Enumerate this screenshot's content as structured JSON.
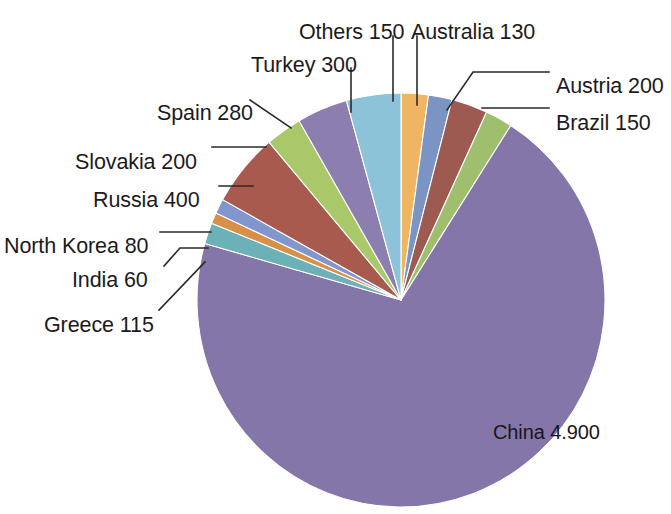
{
  "chart_data": {
    "type": "pie",
    "title": "",
    "subtitle": "",
    "xlabel": "",
    "ylabel": "",
    "legend_position": "none",
    "grid": false,
    "total": 6965,
    "value_separator": ".",
    "start_angle_deg": -90,
    "direction": "clockwise",
    "categories": [
      "China",
      "Australia",
      "Austria",
      "Brazil",
      "Others",
      "Turkey",
      "Spain",
      "Slovakia",
      "Russia",
      "North Korea",
      "India",
      "Greece"
    ],
    "values": [
      4900,
      130,
      200,
      150,
      150,
      300,
      280,
      200,
      400,
      80,
      60,
      115
    ],
    "slices": [
      {
        "name": "China",
        "value": 4900,
        "value_text": "4.900",
        "label": "China 4.900",
        "color": "#8476a8",
        "label_mode": "inside",
        "label_x": 493,
        "label_y": 425
      },
      {
        "name": "Australia",
        "value": 130,
        "value_text": "130",
        "label": "Australia 130",
        "color": "#7b94c4",
        "label_mode": "leader-vertical",
        "label_x": 411,
        "label_y": 24,
        "leader": [
          [
            417,
            36
          ],
          [
            417,
            105
          ]
        ]
      },
      {
        "name": "Austria",
        "value": 200,
        "value_text": "200",
        "label": "Austria 200",
        "color": "#9c5a50",
        "label_mode": "leader-bent",
        "label_x": 556,
        "label_y": 78,
        "leader": [
          [
            447,
            110
          ],
          [
            473,
            72
          ],
          [
            549,
            72
          ]
        ]
      },
      {
        "name": "Brazil",
        "value": 150,
        "value_text": "150",
        "label": "Brazil 150",
        "color": "#9fbf6e",
        "label_mode": "leader-horizontal",
        "label_x": 556,
        "label_y": 115,
        "leader": [
          [
            482,
            108
          ],
          [
            549,
            108
          ]
        ]
      },
      {
        "name": "Others",
        "value": 150,
        "value_text": "150",
        "label": "Others 150",
        "color": "#f0b560",
        "label_mode": "leader-vertical",
        "label_x": 299,
        "label_y": 24,
        "leader": [
          [
            393,
            36
          ],
          [
            393,
            101
          ]
        ]
      },
      {
        "name": "Turkey",
        "value": 300,
        "value_text": "300",
        "label": "Turkey 300",
        "color": "#8cc3d8",
        "label_mode": "leader-vertical",
        "label_x": 251,
        "label_y": 57,
        "leader": [
          [
            351,
            68
          ],
          [
            351,
            112
          ]
        ]
      },
      {
        "name": "Spain",
        "value": 280,
        "value_text": "280",
        "label": "Spain 280",
        "color": "#8c7fb0",
        "label_mode": "leader-diagonal",
        "label_x": 157,
        "label_y": 105,
        "leader": [
          [
            250,
            100
          ],
          [
            291,
            128
          ]
        ]
      },
      {
        "name": "Slovakia",
        "value": 200,
        "value_text": "200",
        "label": "Slovakia 200",
        "color": "#a8c86a",
        "label_mode": "leader-horizontal",
        "label_x": 75,
        "label_y": 154,
        "leader": [
          [
            212,
            147
          ],
          [
            266,
            147
          ]
        ]
      },
      {
        "name": "Russia",
        "value": 400,
        "value_text": "400",
        "label": "Russia 400",
        "color": "#a85a4e",
        "label_mode": "leader-horizontal",
        "label_x": 93,
        "label_y": 192,
        "leader": [
          [
            219,
            186
          ],
          [
            253,
            186
          ]
        ]
      },
      {
        "name": "North Korea",
        "value": 80,
        "value_text": "80",
        "label": "North Korea 80",
        "color": "#8096cc",
        "label_mode": "leader-horizontal",
        "label_x": 4,
        "label_y": 238,
        "leader": [
          [
            160,
            232
          ],
          [
            211,
            232
          ]
        ]
      },
      {
        "name": "India",
        "value": 60,
        "value_text": "60",
        "label": "India 60",
        "color": "#d89048",
        "label_mode": "leader-bent",
        "label_x": 72,
        "label_y": 272,
        "leader": [
          [
            164,
            266
          ],
          [
            180,
            248
          ],
          [
            208,
            248
          ]
        ]
      },
      {
        "name": "Greece",
        "value": 115,
        "value_text": "115",
        "label": "Greece 115",
        "color": "#6cb0b8",
        "label_mode": "leader-diagonal",
        "label_x": 44,
        "label_y": 317,
        "leader": [
          [
            159,
            310
          ],
          [
            205,
            262
          ]
        ]
      }
    ],
    "geometry": {
      "cx": 401,
      "cy": 300,
      "rx": 204,
      "ry": 207
    }
  }
}
